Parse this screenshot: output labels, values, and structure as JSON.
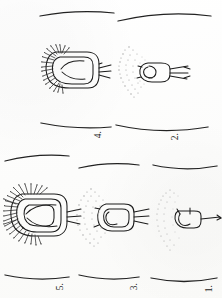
{
  "figure": {
    "kind": "scientific-line-drawing-plate",
    "orientation_note": "page rotated 90 degrees counter-clockwise",
    "background_color": "#fdfdfc",
    "ink_color": "#1b1b1b",
    "stipple_color": "#9a9a9a",
    "panel_count": 5
  },
  "panels": [
    {
      "id": "panel-1",
      "label": "1.",
      "size": "smallest",
      "has_stipple_arc": true,
      "stipple_density": "sparse",
      "has_bristles": false,
      "stalk_count": 1
    },
    {
      "id": "panel-2",
      "label": "2.",
      "size": "small",
      "has_stipple_arc": true,
      "stipple_density": "sparse",
      "has_bristles": false,
      "stalk_count": 2
    },
    {
      "id": "panel-3",
      "label": "3.",
      "size": "medium",
      "has_stipple_arc": true,
      "stipple_density": "medium",
      "has_bristles": false,
      "stalk_count": 2
    },
    {
      "id": "panel-4",
      "label": "4.",
      "size": "large",
      "has_stipple_arc": false,
      "stipple_density": "none",
      "has_bristles": true,
      "stalk_count": 2
    },
    {
      "id": "panel-5",
      "label": "5.",
      "size": "largest",
      "has_stipple_arc": false,
      "stipple_density": "none",
      "has_bristles": true,
      "stalk_count": 2
    }
  ],
  "scale_bars": [
    {
      "id": "bar-top-left",
      "for_panel": "4.",
      "curved": true
    },
    {
      "id": "bar-top-right",
      "for_panel": "2.",
      "curved": true
    },
    {
      "id": "bar-mid-left",
      "for_panel": "4.",
      "curved": true
    },
    {
      "id": "bar-mid-right",
      "for_panel": "2.",
      "curved": true
    },
    {
      "id": "bar-row2-a",
      "for_panel": "5.",
      "curved": true
    },
    {
      "id": "bar-row2-b",
      "for_panel": "3.",
      "curved": true
    },
    {
      "id": "bar-row2-c",
      "for_panel": "1.",
      "curved": true
    },
    {
      "id": "bar-bottom-a",
      "for_panel": "5.",
      "curved": true
    },
    {
      "id": "bar-bottom-b",
      "for_panel": "3.",
      "curved": true
    },
    {
      "id": "bar-bottom-c",
      "for_panel": "1.",
      "curved": true
    }
  ]
}
